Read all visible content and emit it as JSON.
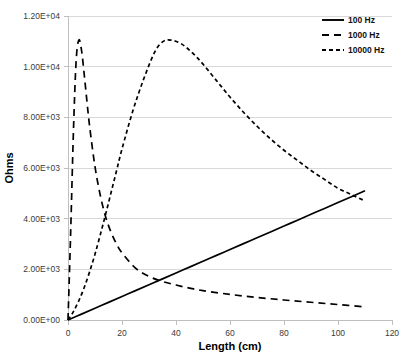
{
  "chart_data": {
    "type": "line",
    "title": "",
    "xlabel": "Length (cm)",
    "ylabel": "Ohms",
    "xlim": [
      0,
      120
    ],
    "ylim": [
      0,
      12000
    ],
    "grid": true,
    "legend_position": "top-right",
    "x_ticks": [
      0,
      20,
      40,
      60,
      80,
      100,
      120
    ],
    "x_tick_labels": [
      "0",
      "20",
      "40",
      "60",
      "80",
      "100",
      "120"
    ],
    "y_ticks": [
      0,
      2000,
      4000,
      6000,
      8000,
      10000,
      12000
    ],
    "y_tick_labels": [
      "0.00E+00",
      "2.00E+03",
      "4.00E+03",
      "6.00E+03",
      "8.00E+03",
      "1.00E+04",
      "1.20E+04"
    ],
    "series": [
      {
        "name": "100 Hz",
        "style": "solid",
        "dash": "none",
        "color": "#000000",
        "x": [
          0,
          5,
          10,
          15,
          20,
          25,
          30,
          35,
          40,
          45,
          50,
          55,
          60,
          65,
          70,
          75,
          80,
          85,
          90,
          95,
          100,
          105,
          110
        ],
        "values": [
          0,
          232,
          464,
          696,
          928,
          1159,
          1391,
          1623,
          1855,
          2086,
          2318,
          2550,
          2782,
          3014,
          3245,
          3477,
          3709,
          3941,
          4173,
          4404,
          4636,
          4868,
          5100
        ]
      },
      {
        "name": "1000 Hz",
        "style": "long-dash",
        "dash": "7,5",
        "color": "#000000",
        "x": [
          0,
          1,
          2,
          3,
          4,
          5,
          6,
          7,
          8,
          10,
          12,
          14,
          16,
          18,
          20,
          25,
          30,
          35,
          40,
          45,
          50,
          60,
          70,
          80,
          90,
          100,
          110
        ],
        "values": [
          0,
          3500,
          7400,
          10200,
          11050,
          10650,
          9700,
          8650,
          7650,
          6050,
          4900,
          4050,
          3450,
          3000,
          2650,
          2050,
          1720,
          1520,
          1380,
          1260,
          1160,
          1010,
          890,
          790,
          700,
          610,
          520
        ]
      },
      {
        "name": "10000 Hz",
        "style": "short-dash",
        "dash": "4,3",
        "color": "#000000",
        "x": [
          0,
          2,
          4,
          6,
          8,
          10,
          12,
          14,
          16,
          18,
          20,
          24,
          28,
          32,
          35,
          38,
          42,
          46,
          50,
          55,
          60,
          65,
          70,
          75,
          80,
          85,
          90,
          95,
          100,
          105,
          110
        ],
        "values": [
          0,
          330,
          760,
          1280,
          1900,
          2600,
          3380,
          4200,
          5050,
          5900,
          6750,
          8250,
          9500,
          10550,
          10980,
          11050,
          10900,
          10550,
          10100,
          9450,
          8800,
          8200,
          7650,
          7150,
          6700,
          6300,
          5900,
          5550,
          5200,
          4950,
          4700
        ]
      }
    ]
  },
  "legend": {
    "entries": [
      {
        "label": "100 Hz"
      },
      {
        "label": "1000 Hz"
      },
      {
        "label": "10000 Hz"
      }
    ]
  }
}
